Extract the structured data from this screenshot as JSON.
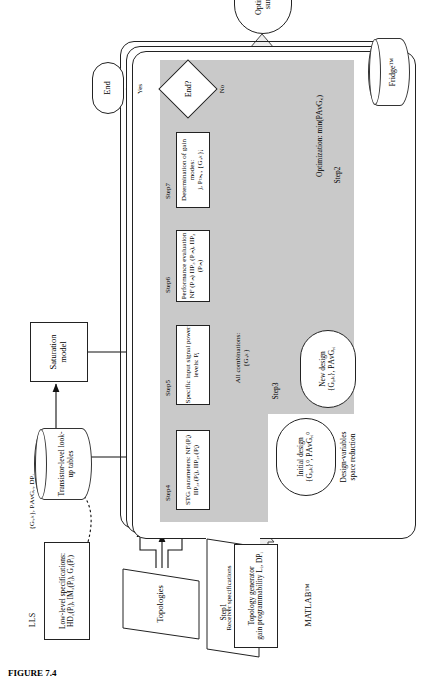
{
  "figure": {
    "caption": "FIGURE 7.4"
  },
  "labels": {
    "lls": "LLS",
    "matlab": "MATLAB™",
    "fridge": "Fridge™",
    "step1": "Step1",
    "step2": "Step2",
    "step3": "Step3",
    "step4": "Step4",
    "step5": "Step5",
    "step6": "Step6",
    "step7": "Step7",
    "yes": "Yes",
    "no": "No",
    "arrow_gij": "{Gᵢ,ₖ}, PΑᴠG,ᵢ, DPᵢ",
    "all_combinations": "All combinations:",
    "all_combinations_val": "{Gᵢ,ₖ}",
    "design_var_1": "Design-variables",
    "design_var_2": "space reduction",
    "optimization_obj": "Optimization: min(PΑᴠG,ᵢ)"
  },
  "nodes": {
    "low_level_spec": {
      "line1": "Low-level specifications:",
      "line2": "HD₁(Pᵢ), IM₃(Pᵢ), G₁(Pᵢ)"
    },
    "lookup_tables": {
      "line1": "Transistor-level look-",
      "line2": "up tables"
    },
    "saturation_model": {
      "label": "Saturation model"
    },
    "topologies": {
      "label": "Topologies"
    },
    "receiver_spec": {
      "line1": "Receiver specifications",
      "line2": "NFˢᵖᵉᶜ(Pᵢₙ), IIP₃ˢᵖᵉᶜ(Pᵢₙ), IIP₂ˢᵖᵉᶜ(Pᵢₙ)"
    },
    "topology_generator": {
      "line1": "Topology generator",
      "line2": "gain programmability Lᵢ, DPᵢ"
    },
    "stg_params": {
      "line1": "STGᵢ parameters: NFᵢ(Pⱼ)",
      "line2": "IIP₃,ᵢ(Pⱼ), IIP₂,ᵢ(Pⱼ)"
    },
    "input_levels": {
      "line1": "Specific input signal power",
      "line2": "levels: Pⱼ"
    },
    "performance_eval": {
      "line1": "Performance evaluation",
      "line2": "NF (Pᵢₙ) IIP₃ (Pᵢₙ), IIP₂ (Pᵢₙ)"
    },
    "gain_modes": {
      "line1": "Determination of gain modes:",
      "line2": "j, Pₜₕ,ᵢ, {Gᵢ,ₖ}ⱼ"
    },
    "initial_design": {
      "line1": "Initial design",
      "line2": "{Gᵢ,ₖ}⁰, PΑᴠG,ᵢ⁰"
    },
    "new_design": {
      "line1": "New design",
      "line2": "{Gᵢ,ₖ}, PΑᴠG,ᵢ"
    },
    "end_decision": {
      "label": "End?"
    },
    "end_terminator": {
      "label": "End"
    },
    "optimization_summary": {
      "line1": "Optimization",
      "line2": "summary"
    }
  },
  "colors": {
    "grey_band": "#c9c9c9",
    "stroke": "#222222",
    "background": "#ffffff"
  }
}
